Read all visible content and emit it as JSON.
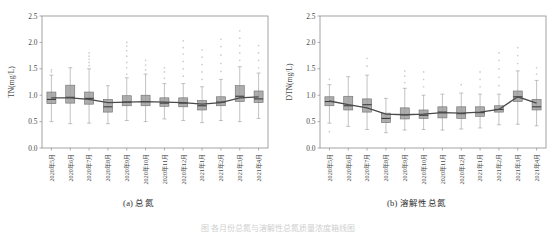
{
  "figure": {
    "caption_cut": "图 各月份总氮与溶解性总氮质量浓度箱线图"
  },
  "panels": [
    {
      "id": "a",
      "caption": "(a) 总氮",
      "chart_data": {
        "type": "box",
        "title": "",
        "xlabel": "",
        "ylabel": "TN(mg/L)",
        "ylim": [
          0.0,
          2.5
        ],
        "yticks": [
          0.0,
          0.5,
          1.0,
          1.5,
          2.0,
          2.5
        ],
        "ytick_labels": [
          "0.0",
          "0.5",
          "1.0",
          "1.5",
          "2.0",
          "2.5"
        ],
        "grid": false,
        "legend": "none",
        "categories": [
          "2020年5月",
          "2020年6月",
          "2020年7月",
          "2020年8月",
          "2020年9月",
          "2020年10月",
          "2020年11月",
          "2020年12月",
          "2021年1月",
          "2021年2月",
          "2021年3月",
          "2021年4月"
        ],
        "boxes": [
          {
            "category": "2020年5月",
            "min": 0.5,
            "q1": 0.84,
            "median": 0.92,
            "q3": 1.06,
            "max": 1.38,
            "outliers": [
              1.44,
              1.48
            ]
          },
          {
            "category": "2020年6月",
            "min": 0.46,
            "q1": 0.85,
            "median": 0.96,
            "q3": 1.19,
            "max": 1.52,
            "outliers": []
          },
          {
            "category": "2020年7月",
            "min": 0.47,
            "q1": 0.83,
            "median": 0.94,
            "q3": 1.06,
            "max": 1.5,
            "outliers": [
              1.56,
              1.62,
              1.68,
              1.74,
              1.8
            ]
          },
          {
            "category": "2020年8月",
            "min": 0.46,
            "q1": 0.68,
            "median": 0.78,
            "q3": 0.92,
            "max": 1.18,
            "outliers": []
          },
          {
            "category": "2020年9月",
            "min": 0.52,
            "q1": 0.8,
            "median": 0.87,
            "q3": 0.99,
            "max": 1.33,
            "outliers": [
              1.4,
              1.52,
              1.62,
              1.74,
              1.84,
              1.93,
              2.0
            ]
          },
          {
            "category": "2020年10月",
            "min": 0.5,
            "q1": 0.8,
            "median": 0.88,
            "q3": 1.0,
            "max": 1.4,
            "outliers": [
              1.48,
              1.57,
              1.66
            ]
          },
          {
            "category": "2020年11月",
            "min": 0.55,
            "q1": 0.79,
            "median": 0.85,
            "q3": 0.95,
            "max": 1.22,
            "outliers": [
              1.32,
              1.44,
              1.52
            ]
          },
          {
            "category": "2020年12月",
            "min": 0.52,
            "q1": 0.78,
            "median": 0.85,
            "q3": 0.95,
            "max": 1.22,
            "outliers": [
              1.36,
              1.5,
              1.64,
              1.78,
              1.9,
              2.03
            ]
          },
          {
            "category": "2021年1月",
            "min": 0.48,
            "q1": 0.72,
            "median": 0.8,
            "q3": 0.9,
            "max": 1.16,
            "outliers": [
              1.3,
              1.44,
              1.58,
              1.72,
              1.86
            ]
          },
          {
            "category": "2021年2月",
            "min": 0.52,
            "q1": 0.8,
            "median": 0.87,
            "q3": 0.97,
            "max": 1.3,
            "outliers": [
              1.45,
              1.6,
              1.76,
              1.92,
              2.06
            ]
          },
          {
            "category": "2021年3月",
            "min": 0.5,
            "q1": 0.88,
            "median": 0.98,
            "q3": 1.18,
            "max": 1.54,
            "outliers": [
              1.66,
              1.8,
              1.94,
              2.08,
              2.22
            ]
          },
          {
            "category": "2021年4月",
            "min": 0.56,
            "q1": 0.86,
            "median": 0.93,
            "q3": 1.08,
            "max": 1.42,
            "outliers": [
              1.52,
              1.66,
              1.8,
              1.94
            ]
          }
        ],
        "trend_line": {
          "name": "均值趋势线",
          "values": [
            0.95,
            0.95,
            0.92,
            0.86,
            0.87,
            0.88,
            0.87,
            0.86,
            0.83,
            0.86,
            0.95,
            0.97
          ]
        }
      }
    },
    {
      "id": "b",
      "caption": "(b) 溶解性总氮",
      "chart_data": {
        "type": "box",
        "title": "",
        "xlabel": "",
        "ylabel": "DTN(mg/L)",
        "ylim": [
          0.0,
          2.5
        ],
        "yticks": [
          0.0,
          0.5,
          1.0,
          1.5,
          2.0,
          2.5
        ],
        "ytick_labels": [
          "0.0",
          "0.5",
          "1.0",
          "1.5",
          "2.0",
          "2.5"
        ],
        "grid": false,
        "legend": "none",
        "categories": [
          "2020年5月",
          "2020年6月",
          "2020年7月",
          "2020年8月",
          "2020年9月",
          "2020年10月",
          "2020年11月",
          "2020年12月",
          "2021年1月",
          "2021年2月",
          "2021年3月",
          "2021年4月"
        ],
        "boxes": [
          {
            "category": "2020年5月",
            "min": 0.47,
            "q1": 0.8,
            "median": 0.88,
            "q3": 0.97,
            "max": 1.2,
            "outliers": [
              1.3,
              0.31
            ]
          },
          {
            "category": "2020年6月",
            "min": 0.41,
            "q1": 0.72,
            "median": 0.8,
            "q3": 0.98,
            "max": 1.35,
            "outliers": []
          },
          {
            "category": "2020年7月",
            "min": 0.35,
            "q1": 0.68,
            "median": 0.82,
            "q3": 0.93,
            "max": 1.38,
            "outliers": [
              1.55,
              1.7
            ]
          },
          {
            "category": "2020年8月",
            "min": 0.29,
            "q1": 0.48,
            "median": 0.56,
            "q3": 0.66,
            "max": 0.94,
            "outliers": []
          },
          {
            "category": "2020年9月",
            "min": 0.34,
            "q1": 0.55,
            "median": 0.63,
            "q3": 0.76,
            "max": 1.13,
            "outliers": [
              1.24,
              1.36,
              1.46
            ]
          },
          {
            "category": "2020年10月",
            "min": 0.35,
            "q1": 0.56,
            "median": 0.62,
            "q3": 0.72,
            "max": 1.0,
            "outliers": [
              1.16,
              1.3,
              1.44
            ]
          },
          {
            "category": "2020年11月",
            "min": 0.34,
            "q1": 0.57,
            "median": 0.68,
            "q3": 0.78,
            "max": 1.02,
            "outliers": []
          },
          {
            "category": "2020年12月",
            "min": 0.36,
            "q1": 0.56,
            "median": 0.65,
            "q3": 0.78,
            "max": 1.04,
            "outliers": [
              1.2
            ]
          },
          {
            "category": "2021年1月",
            "min": 0.38,
            "q1": 0.6,
            "median": 0.67,
            "q3": 0.78,
            "max": 1.02,
            "outliers": [
              1.16,
              1.3,
              1.44
            ]
          },
          {
            "category": "2021年2月",
            "min": 0.44,
            "q1": 0.68,
            "median": 0.73,
            "q3": 0.8,
            "max": 1.02,
            "outliers": [
              1.18,
              1.34,
              1.5,
              1.66,
              1.8
            ]
          },
          {
            "category": "2021年3月",
            "min": 0.45,
            "q1": 0.88,
            "median": 0.97,
            "q3": 1.08,
            "max": 1.46,
            "outliers": [
              1.6,
              1.75,
              1.9
            ]
          },
          {
            "category": "2021年4月",
            "min": 0.42,
            "q1": 0.72,
            "median": 0.78,
            "q3": 0.92,
            "max": 1.28,
            "outliers": [
              1.4,
              1.52
            ]
          }
        ],
        "trend_line": {
          "name": "均值趋势线",
          "values": [
            0.89,
            0.82,
            0.76,
            0.64,
            0.63,
            0.64,
            0.67,
            0.66,
            0.68,
            0.73,
            0.97,
            0.85
          ]
        }
      }
    }
  ]
}
